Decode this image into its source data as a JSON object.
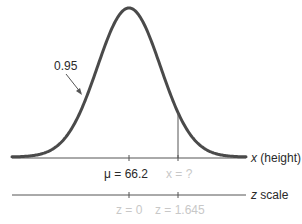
{
  "diagram": {
    "title": "",
    "distribution": "normal",
    "colors": {
      "curve": "#4a4a4a",
      "axis": "#555555",
      "label_dark": "#2a2a2a",
      "label_light": "#c8c8c8"
    },
    "area_label": "0.95",
    "x_axis": {
      "label_var": "x",
      "label_rest": " (height)",
      "ticks": [
        {
          "label": "μ = 66.2",
          "faded": false
        },
        {
          "label": "x = ?",
          "faded": true
        }
      ]
    },
    "z_axis": {
      "label_var": "z",
      "label_rest": " scale",
      "ticks": [
        {
          "label": "z = 0",
          "faded": true
        },
        {
          "label": "z = 1.645",
          "faded": true
        }
      ]
    },
    "geometry": {
      "x_left": 12,
      "x_right": 246,
      "mean_px": 129,
      "sigma_px": 31.5,
      "peak_y": 8,
      "baseline_y": 157,
      "cutoff_px": 178
    }
  },
  "chart_data": {
    "type": "line",
    "mean": 66.2,
    "area_left_of_x": 0.95,
    "x_label": "x (height)",
    "z_label": "z scale",
    "x_ticks": [
      "μ = 66.2",
      "x = ?"
    ],
    "z_ticks": [
      "z = 0",
      "z = 1.645"
    ],
    "annotations": [
      "0.95"
    ],
    "grid": false
  }
}
